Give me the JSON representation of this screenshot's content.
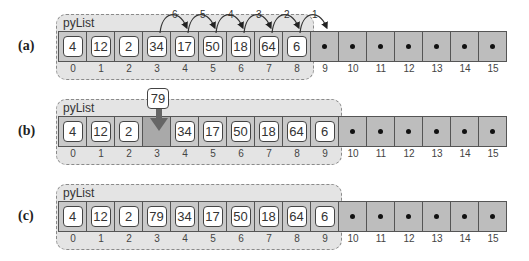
{
  "capacity_indices": [
    "0",
    "1",
    "2",
    "3",
    "4",
    "5",
    "6",
    "7",
    "8",
    "9",
    "10",
    "11",
    "12",
    "13",
    "14",
    "15"
  ],
  "rows": [
    {
      "label": "(a)",
      "list_name": "pyList",
      "values": [
        "4",
        "12",
        "2",
        "34",
        "17",
        "50",
        "18",
        "64",
        "6"
      ],
      "size": 9,
      "shift_arrows": [
        {
          "order": "6",
          "from": 3,
          "to": 4
        },
        {
          "order": "5",
          "from": 4,
          "to": 5
        },
        {
          "order": "4",
          "from": 5,
          "to": 6
        },
        {
          "order": "3",
          "from": 6,
          "to": 7
        },
        {
          "order": "2",
          "from": 7,
          "to": 8
        },
        {
          "order": "1",
          "from": 8,
          "to": 9
        }
      ]
    },
    {
      "label": "(b)",
      "list_name": "pyList",
      "values": [
        "4",
        "12",
        "2",
        "",
        "34",
        "17",
        "50",
        "18",
        "64",
        "6"
      ],
      "size": 10,
      "insert_value": "79",
      "insert_index": 3
    },
    {
      "label": "(c)",
      "list_name": "pyList",
      "values": [
        "4",
        "12",
        "2",
        "79",
        "34",
        "17",
        "50",
        "18",
        "64",
        "6"
      ],
      "size": 10
    }
  ],
  "colors": {
    "panel_bg": "#e4e4e4",
    "cell_used": "#c9c9c9",
    "cell_empty": "#bdbdbd",
    "cell_hole": "#a9a9a9",
    "arrow": "#555555"
  }
}
